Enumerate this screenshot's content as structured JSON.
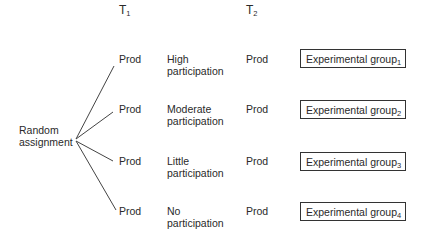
{
  "headers": {
    "t1": {
      "base": "T",
      "sub": "1"
    },
    "t2": {
      "base": "T",
      "sub": "2"
    }
  },
  "root": {
    "line1": "Random",
    "line2": "assignment"
  },
  "branches": [
    {
      "pre": "Prod",
      "condition_line1": "High",
      "condition_line2": "participation",
      "post": "Prod",
      "group_base": "Experimental group",
      "group_sub": "1"
    },
    {
      "pre": "Prod",
      "condition_line1": "Moderate",
      "condition_line2": "participation",
      "post": "Prod",
      "group_base": "Experimental group",
      "group_sub": "2"
    },
    {
      "pre": "Prod",
      "condition_line1": "Little",
      "condition_line2": "participation",
      "post": "Prod",
      "group_base": "Experimental group",
      "group_sub": "3"
    },
    {
      "pre": "Prod",
      "condition_line1": "No",
      "condition_line2": "participation",
      "post": "Prod",
      "group_base": "Experimental group",
      "group_sub": "4"
    }
  ]
}
